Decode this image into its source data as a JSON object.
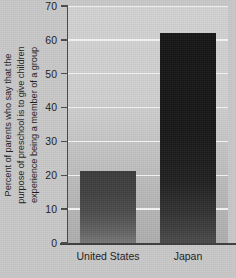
{
  "chart_data": {
    "type": "bar",
    "title": "",
    "subtitle": "",
    "xlabel": "",
    "ylabel": "Percent of parents who say that the purpose of preschool is to give children experience being a member of a group",
    "ylabel_lines": [
      "Percent of parents who say that the",
      "purpose of preschool is to give children",
      "experience being a member of a group"
    ],
    "categories": [
      "United States",
      "Japan"
    ],
    "values": [
      21.3,
      62
    ],
    "ylim": [
      0,
      70
    ],
    "ytick_step": 10,
    "yticks": [
      0,
      10,
      20,
      30,
      40,
      50,
      60,
      70
    ],
    "ytick_labels": [
      "0",
      "10",
      "20",
      "30",
      "40",
      "50",
      "60",
      "70"
    ],
    "grid": "horizontal",
    "legend": "none",
    "annotations": [],
    "series": [
      {
        "name": "Percent of parents",
        "values": [
          21.3,
          62
        ]
      }
    ],
    "colors": {
      "plot_background_top": "#d2d2d2",
      "plot_background_bottom": "#aeaeae",
      "canvas_background": "#c8c8c8",
      "gridline": "#f4f4f4",
      "axis": "#4a4a4a",
      "text": "#1b1b1b",
      "bar_united_states_top": "#3b3b3b",
      "bar_united_states_bottom": "#787878",
      "bar_japan_top": "#151515",
      "bar_japan_bottom": "#4b4b4b"
    }
  }
}
